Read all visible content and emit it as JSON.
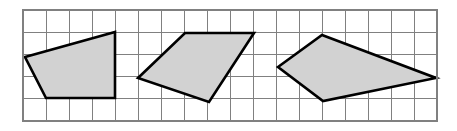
{
  "figure": {
    "background_color": "#ffffff",
    "width": 457,
    "height": 131
  },
  "grid": {
    "name": "square-grid",
    "visible": true,
    "line_color": "#808080",
    "line_width": 1,
    "cell_size": 23,
    "columns": 18,
    "rows": 5,
    "origin_x": 23,
    "origin_y": 10,
    "right": 437,
    "bottom": 121,
    "border_color": "#808080",
    "border_width": 1.4
  },
  "style": {
    "shape_fill": "#d2d2d2",
    "shape_stroke": "#000000",
    "shape_stroke_width": 2.6
  },
  "shapes": [
    {
      "id": "quadrilateral-1",
      "label": "Quadrilateral 1",
      "sides": 4,
      "fill": "#d2d2d2",
      "stroke": "#000000",
      "points_px": [
        [
          25,
          57
        ],
        [
          115,
          32
        ],
        [
          115,
          98
        ],
        [
          46,
          98
        ]
      ],
      "points_grid": [
        [
          0.09,
          2.12
        ],
        [
          4.0,
          0.99
        ],
        [
          4.0,
          3.96
        ],
        [
          1.0,
          3.96
        ]
      ],
      "points_svg": "25,57 115,32 115,98 46,98"
    },
    {
      "id": "quadrilateral-2",
      "label": "Quadrilateral 2",
      "sides": 4,
      "fill": "#d2d2d2",
      "stroke": "#000000",
      "points_px": [
        [
          138,
          78
        ],
        [
          185,
          33
        ],
        [
          254,
          33
        ],
        [
          209,
          102
        ]
      ],
      "points_grid": [
        [
          5.0,
          3.06
        ],
        [
          7.04,
          1.04
        ],
        [
          10.04,
          1.04
        ],
        [
          8.09,
          4.14
        ]
      ],
      "points_svg": "138,78 185,33 254,33 209,102"
    },
    {
      "id": "quadrilateral-3",
      "label": "Quadrilateral 3",
      "sides": 4,
      "fill": "#d2d2d2",
      "stroke": "#000000",
      "points_px": [
        [
          278,
          67
        ],
        [
          322,
          35
        ],
        [
          436,
          78
        ],
        [
          323,
          101
        ]
      ],
      "points_grid": [
        [
          11.09,
          2.57
        ],
        [
          13.0,
          1.13
        ],
        [
          17.96,
          3.06
        ],
        [
          13.04,
          4.1
        ]
      ],
      "points_svg": "278,67 322,35 436,78 323,101"
    }
  ]
}
